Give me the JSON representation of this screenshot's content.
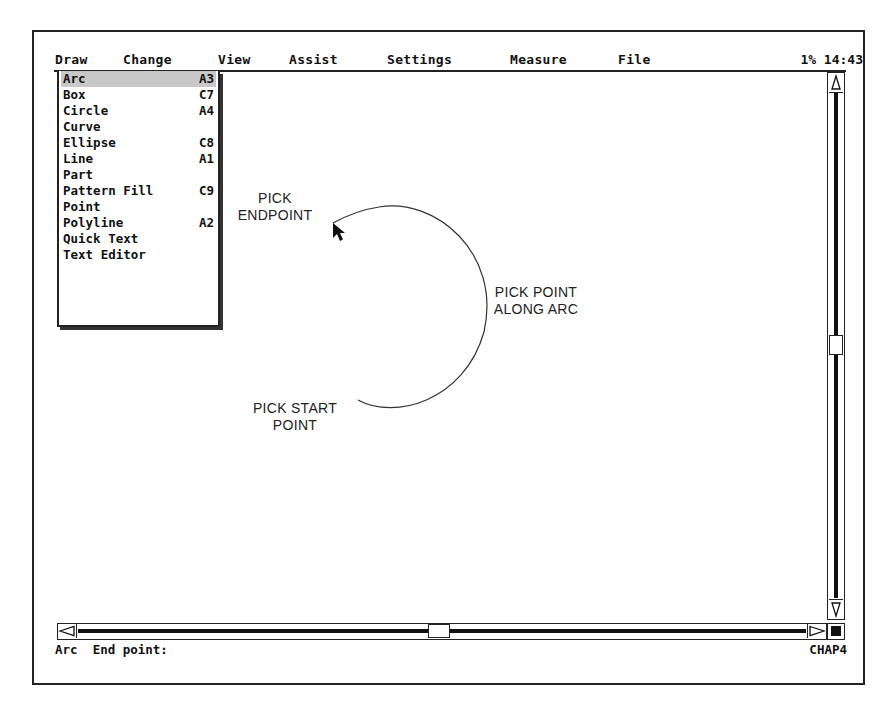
{
  "menubar": {
    "items": [
      "Draw",
      "Change",
      "View",
      "Assist",
      "Settings",
      "Measure",
      "File"
    ],
    "status": "1% 14:43"
  },
  "dropdown": {
    "items": [
      {
        "label": "Arc",
        "shortcut": "A3",
        "selected": true
      },
      {
        "label": "Box",
        "shortcut": "C7"
      },
      {
        "label": "Circle",
        "shortcut": "A4"
      },
      {
        "label": "Curve",
        "shortcut": ""
      },
      {
        "label": "Ellipse",
        "shortcut": "C8"
      },
      {
        "label": "Line",
        "shortcut": "A1"
      },
      {
        "label": "Part",
        "shortcut": ""
      },
      {
        "label": "Pattern Fill",
        "shortcut": "C9"
      },
      {
        "label": "Point",
        "shortcut": ""
      },
      {
        "label": "Polyline",
        "shortcut": "A2"
      },
      {
        "label": "Quick Text",
        "shortcut": ""
      },
      {
        "label": "Text Editor",
        "shortcut": ""
      }
    ]
  },
  "annotations": {
    "endpoint": [
      "PICK",
      "ENDPOINT"
    ],
    "along_arc": [
      "PICK POINT",
      "ALONG ARC"
    ],
    "start_point": [
      "PICK START",
      "POINT"
    ]
  },
  "statusbar": {
    "prompt": "Arc  End point:",
    "file": "CHAP4"
  },
  "colors": {
    "selection": "#c8c8c8",
    "ink": "#111111"
  }
}
